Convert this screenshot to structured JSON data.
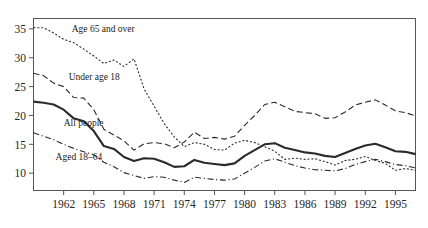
{
  "chart_data": {
    "type": "line",
    "title": "",
    "subtitle": "",
    "xlabel": "",
    "ylabel": "",
    "grid": false,
    "legend_position": "inline-annotations",
    "xlim": [
      1959,
      1997
    ],
    "ylim": [
      7.0,
      36.8
    ],
    "yticks": [
      10,
      15,
      20,
      25,
      30,
      35
    ],
    "ytick_labels": [
      "10",
      "15",
      "20",
      "25",
      "30",
      "35"
    ],
    "xticks": [
      1962,
      1965,
      1968,
      1971,
      1974,
      1977,
      1980,
      1983,
      1986,
      1989,
      1992,
      1995
    ],
    "xtick_labels": [
      "1962",
      "1965",
      "1968",
      "1971",
      "1974",
      "1977",
      "1980",
      "1983",
      "1986",
      "1989",
      "1992",
      "1995"
    ],
    "x": [
      1959,
      1960,
      1961,
      1962,
      1963,
      1964,
      1965,
      1966,
      1967,
      1968,
      1969,
      1970,
      1971,
      1972,
      1973,
      1974,
      1975,
      1976,
      1977,
      1978,
      1979,
      1980,
      1981,
      1982,
      1983,
      1984,
      1985,
      1986,
      1987,
      1988,
      1989,
      1990,
      1991,
      1992,
      1993,
      1994,
      1995,
      1996,
      1997
    ],
    "series": [
      {
        "name": "Age 65 and over",
        "label": "Age 65 and over",
        "style": "dotted",
        "color": "#2b2b2b",
        "values": [
          35.2,
          35.2,
          34.3,
          33.2,
          32.6,
          31.5,
          30.3,
          29.0,
          29.6,
          28.5,
          29.8,
          24.6,
          21.6,
          18.6,
          16.3,
          14.6,
          15.3,
          15.0,
          14.1,
          14.0,
          15.2,
          15.7,
          15.3,
          14.6,
          13.8,
          12.4,
          12.6,
          12.4,
          12.5,
          12.0,
          11.4,
          12.2,
          12.4,
          12.9,
          12.2,
          11.7,
          10.5,
          10.8,
          10.5
        ]
      },
      {
        "name": "Under age 18",
        "label": "Under age 18",
        "style": "dashed",
        "color": "#2b2b2b",
        "values": [
          27.3,
          26.9,
          25.6,
          25.0,
          23.1,
          23.0,
          21.0,
          17.6,
          16.6,
          15.6,
          14.0,
          15.1,
          15.3,
          15.1,
          14.4,
          15.4,
          17.1,
          16.0,
          16.2,
          15.9,
          16.4,
          18.3,
          20.0,
          21.9,
          22.3,
          21.5,
          20.7,
          20.5,
          20.3,
          19.5,
          19.6,
          20.6,
          21.8,
          22.3,
          22.7,
          21.8,
          20.8,
          20.5,
          19.9
        ]
      },
      {
        "name": "All people",
        "label": "All people",
        "style": "solid",
        "color": "#2b2b2b",
        "values": [
          22.4,
          22.2,
          21.9,
          21.0,
          19.5,
          19.0,
          17.3,
          14.7,
          14.2,
          12.8,
          12.1,
          12.6,
          12.5,
          11.9,
          11.1,
          11.2,
          12.3,
          11.8,
          11.6,
          11.4,
          11.7,
          13.0,
          14.0,
          15.0,
          15.2,
          14.4,
          14.0,
          13.6,
          13.4,
          13.0,
          12.8,
          13.5,
          14.2,
          14.8,
          15.1,
          14.5,
          13.8,
          13.7,
          13.3
        ]
      },
      {
        "name": "Aged 18–64",
        "label": "Aged 18–64",
        "style": "dashdot",
        "color": "#2b2b2b",
        "values": [
          17.0,
          16.4,
          15.8,
          15.0,
          14.3,
          13.7,
          13.2,
          11.9,
          11.1,
          10.1,
          9.6,
          9.1,
          9.4,
          9.3,
          8.8,
          8.4,
          9.3,
          9.1,
          8.9,
          8.8,
          9.0,
          10.0,
          11.0,
          12.1,
          12.5,
          11.9,
          11.3,
          10.9,
          10.6,
          10.5,
          10.4,
          10.8,
          11.5,
          12.0,
          12.4,
          12.0,
          11.5,
          11.3,
          10.9
        ]
      }
    ],
    "annotations": [
      {
        "text": "Age 65 and over",
        "x": 1962.8,
        "y": 34.5
      },
      {
        "text": "Under age 18",
        "x": 1962.5,
        "y": 26.2
      },
      {
        "text": "All people",
        "x": 1962.0,
        "y": 18.2
      },
      {
        "text": "Aged 18–64",
        "x": 1961.2,
        "y": 12.2
      }
    ]
  }
}
